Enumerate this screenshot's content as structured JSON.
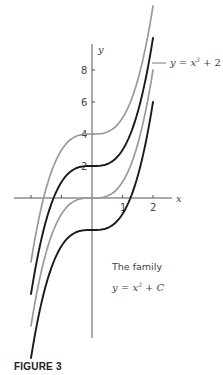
{
  "chart_data": {
    "type": "line",
    "xlabel": "x",
    "ylabel": "y",
    "xlim": [
      -2.55,
      2.6
    ],
    "ylim": [
      -10,
      12.5
    ],
    "x_ticks": [
      -2,
      -1,
      1,
      2
    ],
    "x_tick_labels": [
      "",
      "",
      "1",
      "2"
    ],
    "y_ticks": [
      2,
      4,
      6,
      8
    ],
    "y_tick_labels": [
      "2",
      "4",
      "6",
      "8"
    ],
    "grid": false,
    "legend": null,
    "series": [
      {
        "name": "y = x^3 + 4",
        "C": 4,
        "color": "#9a9a9a",
        "x": [
          -2,
          -1.5,
          -1,
          -0.5,
          0,
          0.5,
          1,
          1.5,
          2
        ],
        "values": [
          -4,
          0.625,
          3,
          3.875,
          4,
          4.125,
          5,
          7.375,
          12
        ]
      },
      {
        "name": "y = x^3 + 2",
        "C": 2,
        "color": "#1a1a1a",
        "x": [
          -2,
          -1.5,
          -1,
          -0.5,
          0,
          0.5,
          1,
          1.5,
          2
        ],
        "values": [
          -6,
          -1.375,
          1,
          1.875,
          2,
          2.125,
          3,
          5.375,
          10
        ]
      },
      {
        "name": "y = x^3",
        "C": 0,
        "color": "#9a9a9a",
        "x": [
          -2,
          -1.5,
          -1,
          -0.5,
          0,
          0.5,
          1,
          1.5,
          2
        ],
        "values": [
          -8,
          -3.375,
          -1,
          -0.125,
          0,
          0.125,
          1,
          3.375,
          8
        ]
      },
      {
        "name": "y = x^3 - 2",
        "C": -2,
        "color": "#1a1a1a",
        "x": [
          -2,
          -1.5,
          -1,
          -0.5,
          0,
          0.5,
          1,
          1.5,
          2
        ],
        "values": [
          -10,
          -5.375,
          -3,
          -2.125,
          -2,
          -1.875,
          -1,
          1.375,
          6
        ]
      }
    ],
    "annotations": [
      {
        "text": "y = x³ + 2",
        "points_to": "y = x^3 + 2",
        "position": "upper right"
      },
      {
        "text": "The family",
        "position": "lower right"
      },
      {
        "text": "y = x³ + C",
        "position": "lower right"
      }
    ]
  },
  "labels": {
    "x_axis": "x",
    "y_axis": "y",
    "x_tick_1": "1",
    "x_tick_2": "2",
    "y_tick_2": "2",
    "y_tick_4": "4",
    "y_tick_6": "6",
    "y_tick_8": "8",
    "curve_label_prefix": "y = x",
    "curve_label_exp": "3",
    "curve_label_suffix": " + 2",
    "family_title": "The family",
    "family_eq_prefix": "y = x",
    "family_eq_exp": "3",
    "family_eq_suffix": " + C",
    "caption": "FIGURE 3"
  }
}
